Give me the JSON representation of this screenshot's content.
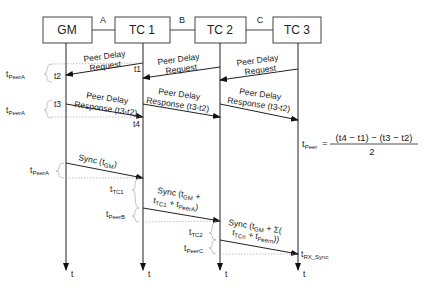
{
  "nodes": [
    {
      "id": "gm",
      "label": "GM"
    },
    {
      "id": "tc1",
      "label": "TC 1"
    },
    {
      "id": "tc2",
      "label": "TC 2"
    },
    {
      "id": "tc3",
      "label": "TC 3"
    }
  ],
  "links": [
    {
      "label": "A"
    },
    {
      "label": "B"
    },
    {
      "label": "C"
    }
  ],
  "axis_label": "t",
  "peer_delay": {
    "request_line1": "Peer Delay",
    "request_line2": "Request",
    "response_line1": "Peer Delay",
    "response_line2": "Response (t3-t2)",
    "t1": "t1",
    "t2": "t2",
    "t3": "t3",
    "t4": "t4",
    "t_peer_a_main": "t",
    "t_peer_a_sub": "PeerA"
  },
  "formula": {
    "lhs_main": "t",
    "lhs_sub": "Peer",
    "equals": "=",
    "numerator": "(t4 − t1) − (t3 − t2)",
    "denominator": "2"
  },
  "sync": {
    "gm_msg_main": "Sync  (t",
    "gm_msg_sub": "GM",
    "gm_msg_end": ")",
    "tc1_line1_main": "Sync  (t",
    "tc1_line1_sub": "GM",
    "tc1_line1_end": " +",
    "tc1_line2_a": "t",
    "tc1_line2_a_sub": "TC1",
    "tc1_line2_b": " + t",
    "tc1_line2_b_sub": "PeerA",
    "tc1_line2_end": ")",
    "tc2_line1_main": "Sync  (t",
    "tc2_line1_sub": "GM",
    "tc2_line1_end": " + Σ(",
    "tc2_line2_a": "t",
    "tc2_line2_a_sub": "TCn",
    "tc2_line2_b": "  + t",
    "tc2_line2_b_sub": "Peern",
    "tc2_line2_end": "))",
    "t_peer_a_main": "t",
    "t_peer_a_sub": "PeerA",
    "t_tc1_main": "t",
    "t_tc1_sub": "TC1",
    "t_peer_b_main": "t",
    "t_peer_b_sub": "PeerB",
    "t_tc2_main": "t",
    "t_tc2_sub": "TC2",
    "t_peer_c_main": "t",
    "t_peer_c_sub": "PeerC",
    "t_rx_main": "t",
    "t_rx_sub": "RX_Sync"
  }
}
